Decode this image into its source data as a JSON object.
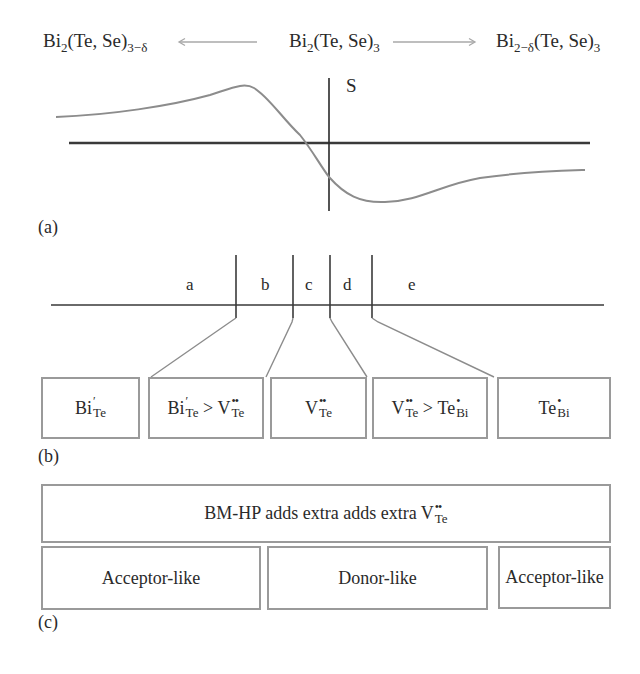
{
  "figure": {
    "panel_a": {
      "label": "(a)",
      "formulas": {
        "left": {
          "base": "Bi",
          "sub1": "2",
          "mid": "(Te, Se)",
          "sub2": "3−δ"
        },
        "center": {
          "base": "Bi",
          "sub1": "2",
          "mid": "(Te, Se)",
          "sub2": "3"
        },
        "right": {
          "base": "Bi",
          "sub1": "2−δ",
          "mid": "(Te, Se)",
          "sub2": "3"
        }
      },
      "arrows": {
        "left": "arrow-left",
        "right": "arrow-right"
      },
      "axis_label": "S",
      "curve": {
        "description": "Seebeck coefficient S vs stoichiometry; positive on Te-deficient side, negative on Bi-deficient side",
        "points": [
          [
            56,
            117
          ],
          [
            150,
            108
          ],
          [
            245,
            85
          ],
          [
            280,
            110
          ],
          [
            307,
            142
          ],
          [
            329,
            177
          ],
          [
            380,
            201
          ],
          [
            470,
            180
          ],
          [
            585,
            170
          ]
        ]
      }
    },
    "panel_b": {
      "label": "(b)",
      "regions": [
        "a",
        "b",
        "c",
        "d",
        "e"
      ],
      "boxes": [
        {
          "id": "box1",
          "parts": [
            {
              "t": "Bi",
              "sup": "′",
              "sub": "Te"
            }
          ]
        },
        {
          "id": "box2",
          "parts": [
            {
              "t": "Bi",
              "sup": "′",
              "sub": "Te"
            },
            {
              "op": " > "
            },
            {
              "t": "V",
              "sup": "••",
              "sub": "Te"
            }
          ]
        },
        {
          "id": "box3",
          "parts": [
            {
              "t": "V",
              "sup": "••",
              "sub": "Te"
            }
          ]
        },
        {
          "id": "box4",
          "parts": [
            {
              "t": "V",
              "sup": "••",
              "sub": "Te"
            },
            {
              "op": " > "
            },
            {
              "t": "Te",
              "sup": "•",
              "sub": "Bi"
            }
          ]
        },
        {
          "id": "box5",
          "parts": [
            {
              "t": "Te",
              "sup": "•",
              "sub": "Bi"
            }
          ]
        }
      ],
      "box_texts": {
        "box1": {
          "a_base": "Bi",
          "a_sup": "′",
          "a_sub": "Te"
        },
        "box2": {
          "a_base": "Bi",
          "a_sup": "′",
          "a_sub": "Te",
          "op": ">",
          "b_base": "V",
          "b_sup": "••",
          "b_sub": "Te"
        },
        "box3": {
          "a_base": "V",
          "a_sup": "••",
          "a_sub": "Te"
        },
        "box4": {
          "a_base": "V",
          "a_sup": "••",
          "a_sub": "Te",
          "op": ">",
          "b_base": "Te",
          "b_sup": "•",
          "b_sub": "Bi"
        },
        "box5": {
          "a_base": "Te",
          "a_sup": "•",
          "a_sub": "Bi"
        }
      }
    },
    "panel_c": {
      "label": "(c)",
      "top_box": {
        "text": "BM-HP adds extra adds extra V",
        "sup": "••",
        "sub": "Te"
      },
      "bottom_boxes": [
        "Acceptor-like",
        "Donor-like",
        "Acceptor-like"
      ]
    },
    "colors": {
      "axis": "#2a2a2a",
      "curve": "#8c8c8c",
      "box_border": "#9a9a9a",
      "connector": "#8c8c8c",
      "text": "#2a2a2a"
    }
  }
}
